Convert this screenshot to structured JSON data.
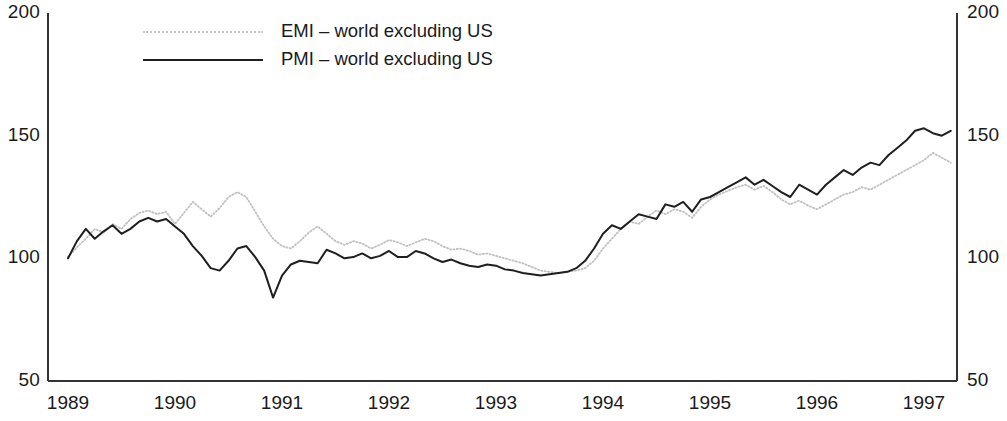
{
  "chart_data": {
    "type": "line",
    "title": "",
    "subtitle": "",
    "xlabel": "",
    "ylabel": "",
    "xlim": [
      1989.0,
      1997.5
    ],
    "ylim": [
      50,
      200
    ],
    "grid": false,
    "legend_position": "top-center",
    "y_ticks": [
      50,
      100,
      150,
      200
    ],
    "y_ticks_right": [
      50,
      100,
      150,
      200
    ],
    "x_ticks": [
      1989,
      1990,
      1991,
      1992,
      1993,
      1994,
      1995,
      1996,
      1997
    ],
    "x_tick_labels": [
      "1989",
      "1990",
      "1991",
      "1992",
      "1993",
      "1994",
      "1995",
      "1996",
      "1997"
    ],
    "dual_axis": true,
    "series": [
      {
        "name": "EMI – world excluding US",
        "style": "dotted",
        "color": "#c0c0c0",
        "values": [
          100.5,
          104.5,
          108.0,
          112.0,
          110.5,
          114.0,
          112.0,
          116.0,
          118.5,
          119.5,
          118.0,
          119.0,
          114.0,
          118.5,
          123.0,
          120.0,
          117.0,
          120.5,
          125.0,
          127.0,
          125.0,
          119.0,
          113.0,
          108.0,
          105.0,
          104.0,
          107.0,
          110.5,
          113.0,
          110.0,
          107.0,
          105.5,
          107.0,
          106.0,
          104.0,
          105.5,
          107.5,
          106.5,
          105.0,
          106.5,
          108.0,
          107.0,
          105.0,
          103.5,
          104.0,
          103.0,
          101.5,
          102.0,
          101.0,
          100.0,
          99.0,
          98.0,
          96.5,
          95.0,
          94.5,
          94.0,
          94.5,
          95.0,
          96.0,
          99.0,
          104.0,
          108.0,
          112.0,
          115.0,
          114.0,
          117.0,
          119.5,
          118.0,
          120.0,
          119.0,
          116.5,
          121.0,
          124.0,
          126.0,
          127.5,
          129.0,
          130.0,
          128.0,
          129.5,
          127.0,
          124.0,
          122.0,
          123.5,
          121.5,
          120.0,
          122.0,
          124.0,
          126.0,
          127.0,
          129.0,
          128.0,
          130.0,
          132.0,
          134.0,
          136.0,
          138.0,
          140.0,
          143.0,
          141.0,
          139.0,
          138.0,
          139.0,
          138.0,
          137.0,
          139.0,
          141.0,
          143.0,
          142.0,
          143.0,
          144.0,
          143.0,
          141.0,
          138.0,
          134.0,
          130.5
        ]
      },
      {
        "name": "PMI – world excluding US",
        "style": "solid",
        "color": "#1f1f1f",
        "values": [
          100.0,
          107.0,
          112.0,
          108.0,
          111.0,
          113.5,
          110.0,
          112.0,
          115.0,
          116.5,
          115.0,
          116.0,
          113.0,
          110.0,
          105.0,
          101.0,
          96.0,
          95.0,
          99.0,
          104.0,
          105.0,
          100.5,
          95.0,
          84.0,
          93.0,
          97.5,
          99.0,
          98.5,
          98.0,
          103.5,
          102.0,
          100.0,
          100.5,
          102.0,
          100.0,
          101.0,
          103.0,
          100.5,
          100.5,
          103.0,
          102.0,
          100.0,
          98.5,
          99.5,
          98.0,
          97.0,
          96.5,
          97.5,
          97.0,
          95.5,
          95.0,
          94.0,
          93.5,
          93.0,
          93.5,
          94.0,
          94.5,
          96.0,
          99.0,
          104.0,
          110.0,
          113.5,
          112.0,
          115.0,
          118.0,
          117.0,
          116.0,
          122.0,
          121.0,
          123.0,
          119.0,
          124.0,
          125.0,
          127.0,
          129.0,
          131.0,
          133.0,
          130.0,
          132.0,
          129.5,
          127.0,
          125.0,
          130.0,
          128.0,
          126.0,
          130.0,
          133.0,
          136.0,
          134.0,
          137.0,
          139.0,
          138.0,
          142.0,
          145.0,
          148.0,
          152.0,
          153.0,
          151.0,
          150.0,
          152.0,
          156.0,
          155.0,
          154.0,
          152.0,
          155.0,
          158.0,
          162.0,
          158.0,
          166.0,
          176.0,
          183.0,
          168.0,
          179.0,
          170.0,
          167.0,
          168.5
        ]
      }
    ]
  },
  "legend": {
    "items": [
      {
        "label": "EMI – world excluding US",
        "style": "dotted"
      },
      {
        "label": "PMI – world excluding US",
        "style": "solid"
      }
    ]
  },
  "axes": {
    "left_labels": [
      "200",
      "150",
      "100",
      "50"
    ],
    "right_labels": [
      "200",
      "150",
      "100",
      "50"
    ],
    "x_labels": [
      "1989",
      "1990",
      "1991",
      "1992",
      "1993",
      "1994",
      "1995",
      "1996",
      "1997"
    ]
  }
}
